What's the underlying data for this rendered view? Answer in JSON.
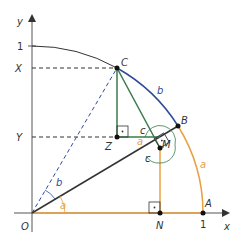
{
  "axes": {
    "x_label": "x",
    "y_label": "y",
    "x_tick_one": "1",
    "y_tick_one": "1",
    "origin_label": "O"
  },
  "points": {
    "A": "A",
    "B": "B",
    "C": "C",
    "M": "M",
    "N": "N",
    "Z": "Z",
    "X": "X",
    "Y": "Y"
  },
  "angles": {
    "a_origin": "a",
    "b_origin": "b",
    "a_at_M": "a",
    "c_upper_at_M": "c",
    "c_lower_at_M": "c"
  },
  "arcs": {
    "arc_a_label": "a",
    "arc_b_label": "b"
  },
  "colors": {
    "orange": "#e8a040",
    "blue": "#2d4a9a",
    "green": "#3a7a4a",
    "dark": "#333333",
    "axis": "#666666"
  }
}
